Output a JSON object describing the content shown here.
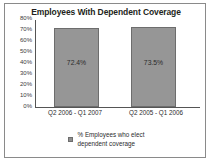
{
  "chart_data": {
    "type": "bar",
    "title": "Employees With Dependent Coverage",
    "xlabel": "",
    "ylabel": "",
    "categories": [
      "Q2 2006 - Q1 2007",
      "Q2 2005 - Q1 2006"
    ],
    "values": [
      72.4,
      73.5
    ],
    "value_labels": [
      "72.4%",
      "73.5%"
    ],
    "ylim": [
      0,
      80
    ],
    "ytick_labels": [
      "80%",
      "70%",
      "60%",
      "50%",
      "40%",
      "30%",
      "20%",
      "10%",
      "0%"
    ],
    "ytick_values": [
      80,
      70,
      60,
      50,
      40,
      30,
      20,
      10,
      0
    ],
    "grid": false,
    "legend_position": "bottom",
    "series": [
      {
        "name": "% Employees who elect dependent coverage",
        "values": [
          72.4,
          73.5
        ],
        "color": "#969696"
      }
    ]
  },
  "legend": {
    "marker_name": "legend-square-marker",
    "label_line_1": "% Employees who elect",
    "label_line_2": "dependent coverage"
  },
  "colors": {
    "bar_fill": "#969696",
    "bar_border": "#6d6d6d",
    "axis": "#555555",
    "frame": "#8a8a8a",
    "text": "#2b2b2b"
  }
}
